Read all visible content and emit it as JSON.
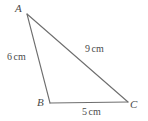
{
  "figure": {
    "kind": "geometry-diagram",
    "shape": "triangle",
    "background_color": "#ffffff",
    "stroke_color": "#6e6e6e",
    "text_color": "#4a4a4a",
    "vertices": [
      {
        "name": "A",
        "label": "A",
        "x": 27,
        "y": 14
      },
      {
        "name": "B",
        "label": "B",
        "x": 50,
        "y": 103
      },
      {
        "name": "C",
        "label": "C",
        "x": 128,
        "y": 102
      }
    ],
    "sides": [
      {
        "name": "AB",
        "from": "A",
        "to": "B",
        "value": "6",
        "unit": "cm",
        "label": "6 cm"
      },
      {
        "name": "AC",
        "from": "A",
        "to": "C",
        "value": "9",
        "unit": "cm",
        "label": "9 cm"
      },
      {
        "name": "BC",
        "from": "B",
        "to": "C",
        "value": "5",
        "unit": "cm",
        "label": "5 cm"
      }
    ]
  }
}
